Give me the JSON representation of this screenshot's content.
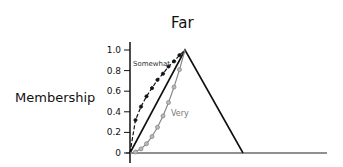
{
  "chart_data": {
    "type": "line",
    "title": "Far",
    "xlabel": "",
    "ylabel": "Membership",
    "ylim": [
      0,
      1.0
    ],
    "yticks": [
      "0",
      "0.2",
      "0.4",
      "0.6",
      "0.8",
      "1.0"
    ],
    "grid": false,
    "legend": "none (inline annotations)",
    "series": [
      {
        "name": "Far",
        "style": "solid black triangle",
        "x": [
          0,
          1,
          2
        ],
        "y": [
          0,
          1.0,
          0
        ]
      },
      {
        "name": "Somewhat",
        "style": "dashed black with dots (concave, above linear)",
        "x": [
          0,
          0.1,
          0.2,
          0.3,
          0.4,
          0.5,
          0.6,
          0.7,
          0.8,
          0.9,
          1.0
        ],
        "y": [
          0,
          0.32,
          0.45,
          0.55,
          0.63,
          0.71,
          0.77,
          0.84,
          0.89,
          0.95,
          1.0
        ]
      },
      {
        "name": "Very",
        "style": "gray with circles (convex, below linear)",
        "x": [
          0,
          0.1,
          0.2,
          0.3,
          0.4,
          0.5,
          0.6,
          0.7,
          0.8,
          0.9,
          1.0
        ],
        "y": [
          0,
          0.01,
          0.04,
          0.09,
          0.16,
          0.25,
          0.36,
          0.49,
          0.64,
          0.81,
          1.0
        ]
      }
    ],
    "annotations": [
      "Somewhat",
      "Very"
    ]
  },
  "labels": {
    "title": "Far",
    "ylabel": "Membership",
    "somewhat": "Somewhat",
    "very": "Very"
  },
  "colors": {
    "line": "#111111",
    "very": "#888888"
  }
}
